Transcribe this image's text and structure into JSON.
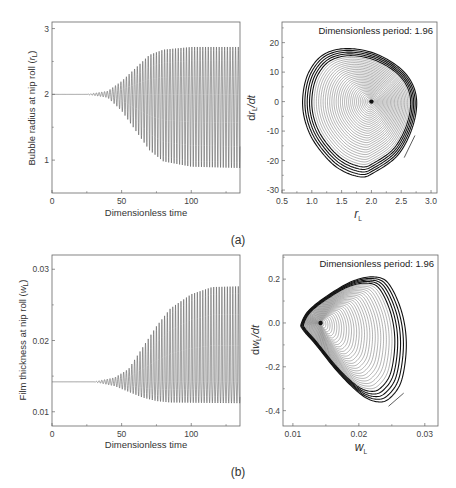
{
  "figure": {
    "panels": [
      {
        "id": "a",
        "label": "(a)"
      },
      {
        "id": "b",
        "label": "(b)"
      }
    ]
  },
  "chart_data": [
    {
      "id": "a-time",
      "type": "line",
      "title": "",
      "xlabel": "Dimensionless time",
      "ylabel": "Bubble radius at nip roll (r_L)",
      "ylabel_parts": {
        "text": "Bubble radius at nip roll (",
        "var": "r",
        "sub": "L",
        "close": ")"
      },
      "xlim": [
        0,
        135
      ],
      "ylim": [
        0.5,
        3.1
      ],
      "xticks": [
        0,
        50,
        100
      ],
      "yticks": [
        1,
        2,
        3
      ],
      "grid": false,
      "series": [
        {
          "name": "r_L(t)",
          "description": "Oscillation around steady state 2.0 growing from t≈25 to saturated amplitude by t≈100",
          "steady_value": 2.0,
          "envelope_upper": [
            [
              0,
              2.0
            ],
            [
              25,
              2.0
            ],
            [
              40,
              2.05
            ],
            [
              50,
              2.2
            ],
            [
              60,
              2.4
            ],
            [
              70,
              2.6
            ],
            [
              80,
              2.68
            ],
            [
              100,
              2.72
            ],
            [
              135,
              2.72
            ]
          ],
          "envelope_lower": [
            [
              0,
              2.0
            ],
            [
              25,
              2.0
            ],
            [
              40,
              1.95
            ],
            [
              50,
              1.75
            ],
            [
              60,
              1.45
            ],
            [
              70,
              1.15
            ],
            [
              80,
              0.98
            ],
            [
              100,
              0.9
            ],
            [
              135,
              0.88
            ]
          ],
          "period": 1.96
        }
      ]
    },
    {
      "id": "a-phase",
      "type": "line",
      "title": "",
      "annotation": "Dimensionless period: 1.96",
      "xlabel": "r_L",
      "xlabel_parts": {
        "var": "r",
        "sub": "L"
      },
      "ylabel": "dr_L/dt",
      "ylabel_parts": {
        "pre": "d",
        "var": "r",
        "sub": "L",
        "post": "/dt"
      },
      "xlim": [
        0.5,
        3.1
      ],
      "ylim": [
        -31,
        27
      ],
      "xticks": [
        0.5,
        1.0,
        1.5,
        2.0,
        2.5,
        3.0
      ],
      "yticks": [
        -30,
        -20,
        -10,
        0,
        10,
        20
      ],
      "grid": false,
      "series": [
        {
          "name": "phase trajectory",
          "description": "Spiral from fixed point (2.0, 0) outward to limit cycle",
          "fixed_point": [
            2.0,
            0
          ],
          "limit_cycle": [
            [
              0.85,
              2
            ],
            [
              0.95,
              10
            ],
            [
              1.2,
              16
            ],
            [
              1.6,
              18
            ],
            [
              2.1,
              16
            ],
            [
              2.55,
              10
            ],
            [
              2.75,
              2
            ],
            [
              2.7,
              -8
            ],
            [
              2.45,
              -18
            ],
            [
              2.05,
              -24
            ],
            [
              1.8,
              -25.5
            ],
            [
              1.4,
              -22
            ],
            [
              1.05,
              -14
            ],
            [
              0.88,
              -6
            ]
          ],
          "arrow_segment": [
            [
              2.55,
              -19
            ],
            [
              2.73,
              -11.5
            ]
          ]
        }
      ]
    },
    {
      "id": "b-time",
      "type": "line",
      "title": "",
      "xlabel": "Dimensionless time",
      "ylabel": "Film thickness at nip roll (w_L)",
      "ylabel_parts": {
        "text": "Film thickness at nip roll (",
        "var": "w",
        "sub": "L",
        "close": ")"
      },
      "xlim": [
        0,
        135
      ],
      "ylim": [
        0.008,
        0.032
      ],
      "xticks": [
        0,
        50,
        100
      ],
      "yticks": [
        0.01,
        0.02,
        0.03
      ],
      "grid": false,
      "series": [
        {
          "name": "w_L(t)",
          "description": "Oscillation around steady state 0.0142 growing from t≈30 to saturated amplitude by t≈115",
          "steady_value": 0.0142,
          "envelope_upper": [
            [
              0,
              0.0142
            ],
            [
              30,
              0.0142
            ],
            [
              45,
              0.0148
            ],
            [
              55,
              0.016
            ],
            [
              65,
              0.019
            ],
            [
              75,
              0.022
            ],
            [
              85,
              0.0245
            ],
            [
              100,
              0.0265
            ],
            [
              115,
              0.0275
            ],
            [
              135,
              0.0276
            ]
          ],
          "envelope_lower": [
            [
              0,
              0.0142
            ],
            [
              30,
              0.0142
            ],
            [
              45,
              0.0136
            ],
            [
              55,
              0.0128
            ],
            [
              65,
              0.012
            ],
            [
              75,
              0.0115
            ],
            [
              85,
              0.0113
            ],
            [
              135,
              0.0112
            ]
          ],
          "period": 1.96
        }
      ]
    },
    {
      "id": "b-phase",
      "type": "line",
      "title": "",
      "annotation": "Dimensionless period: 1.96",
      "xlabel": "w_L",
      "xlabel_parts": {
        "var": "w",
        "sub": "L"
      },
      "ylabel": "dw_L/dt",
      "ylabel_parts": {
        "pre": "d",
        "var": "w",
        "sub": "L",
        "post": "/dt"
      },
      "xlim": [
        0.0085,
        0.032
      ],
      "ylim": [
        -0.47,
        0.31
      ],
      "xticks": [
        0.01,
        0.02,
        0.03
      ],
      "yticks": [
        -0.4,
        -0.2,
        0.0,
        0.2
      ],
      "grid": false,
      "series": [
        {
          "name": "phase trajectory",
          "description": "Spiral from fixed point (0.0142, 0) outward to limit cycle",
          "fixed_point": [
            0.0142,
            0.0
          ],
          "limit_cycle": [
            [
              0.0113,
              0.0
            ],
            [
              0.0125,
              0.06
            ],
            [
              0.0155,
              0.13
            ],
            [
              0.019,
              0.19
            ],
            [
              0.0222,
              0.21
            ],
            [
              0.0245,
              0.18
            ],
            [
              0.0265,
              0.05
            ],
            [
              0.0272,
              -0.1
            ],
            [
              0.0265,
              -0.26
            ],
            [
              0.0248,
              -0.34
            ],
            [
              0.023,
              -0.36
            ],
            [
              0.0205,
              -0.33
            ],
            [
              0.017,
              -0.23
            ],
            [
              0.0135,
              -0.1
            ],
            [
              0.0115,
              -0.03
            ]
          ],
          "arrow_segment": [
            [
              0.0245,
              -0.38
            ],
            [
              0.0268,
              -0.32
            ]
          ]
        }
      ]
    }
  ]
}
